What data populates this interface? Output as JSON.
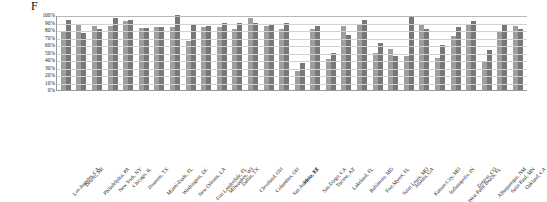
{
  "figure": {
    "label": "F"
  },
  "chart_data": {
    "type": "bar",
    "title": "F",
    "xlabel": "",
    "ylabel": "",
    "ylim": [
      0,
      100
    ],
    "grid": true,
    "legend_position": "none",
    "ytick_labels": [
      "100%",
      "90%",
      "80%",
      "70%",
      "60%",
      "50%",
      "40%",
      "30%",
      "20%",
      "10%",
      "0%"
    ],
    "ytick_values": [
      100,
      90,
      80,
      70,
      60,
      50,
      40,
      30,
      20,
      10,
      0
    ],
    "categories": [
      "Los Angeles, CA",
      "Detroit, MI",
      "Philadelphia, PA",
      "New York, NY",
      "Chicago, IL",
      "Houston, TX",
      "Miami-Dade, FL",
      "Washington, DC",
      "New Orleans, LA",
      "Fort Lauderdale, FL",
      "Milwaukee, WI",
      "Dallas, TX",
      "Cleveland, OH",
      "Columbus, OH",
      "San Antonio, TX",
      "Mesa, AZ",
      "San Diego, CA",
      "Tucson, AZ",
      "Lakeland, FL",
      "Baltimore, MD",
      "Fort Myers, FL",
      "Saint Louis, MO",
      "Atlanta, GA",
      "Kansas City, MO",
      "Indianapolis, IN",
      "West Palm Beach, FL",
      "Denver, CO",
      "Albuquerque, NM",
      "Saint Paul, MN",
      "Oakland, CA"
    ],
    "series": [
      {
        "name": "Series 1",
        "color": "#9e9e9e",
        "values": [
          77,
          88,
          85,
          85,
          92,
          83,
          84,
          84,
          65,
          84,
          84,
          81,
          96,
          86,
          81,
          25,
          82,
          41,
          86,
          88,
          50,
          55,
          46,
          87,
          43,
          72,
          88,
          38,
          79,
          86
        ]
      },
      {
        "name": "Series 2",
        "color": "#777777",
        "values": [
          94,
          76,
          82,
          96,
          94,
          83,
          84,
          100,
          88,
          86,
          89,
          89,
          90,
          88,
          90,
          36,
          85,
          49,
          74,
          93,
          63,
          46,
          97,
          81,
          60,
          84,
          92,
          53,
          87,
          81
        ]
      }
    ]
  }
}
